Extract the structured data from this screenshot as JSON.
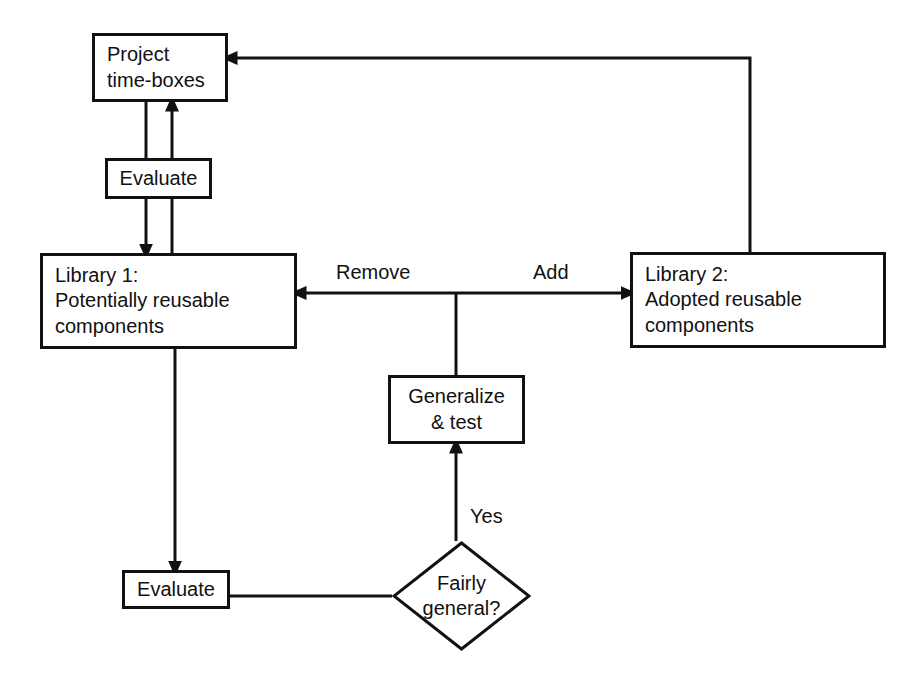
{
  "diagram": {
    "type": "flowchart",
    "background_color": "#ffffff",
    "line_color": "#111111",
    "text_color": "#111111",
    "nodes": [
      {
        "id": "project-time-boxes",
        "shape": "rectangle",
        "lines": [
          "Project",
          "time-boxes"
        ],
        "x": 92,
        "y": 33,
        "w": 136,
        "h": 69,
        "align": "left",
        "font_size": 20
      },
      {
        "id": "evaluate-top",
        "shape": "rectangle",
        "lines": [
          "Evaluate"
        ],
        "x": 105,
        "y": 158,
        "w": 107,
        "h": 41,
        "align": "center",
        "font_size": 20
      },
      {
        "id": "library-1",
        "shape": "rectangle",
        "lines": [
          "Library 1:",
          "Potentially reusable",
          "components"
        ],
        "x": 40,
        "y": 253,
        "w": 257,
        "h": 96,
        "align": "left",
        "font_size": 20
      },
      {
        "id": "library-2",
        "shape": "rectangle",
        "lines": [
          "Library 2:",
          "Adopted reusable",
          "components"
        ],
        "x": 630,
        "y": 252,
        "w": 256,
        "h": 96,
        "align": "left",
        "font_size": 20
      },
      {
        "id": "generalize-test",
        "shape": "rectangle",
        "lines": [
          "Generalize",
          "& test"
        ],
        "x": 388,
        "y": 375,
        "w": 137,
        "h": 69,
        "align": "center",
        "font_size": 20
      },
      {
        "id": "evaluate-bottom",
        "shape": "rectangle",
        "lines": [
          "Evaluate"
        ],
        "x": 122,
        "y": 570,
        "w": 108,
        "h": 39,
        "align": "center",
        "font_size": 20
      },
      {
        "id": "fairly-general",
        "shape": "diamond",
        "lines": [
          "Fairly",
          "general?"
        ],
        "x": 392,
        "y": 541,
        "w": 139,
        "h": 110,
        "align": "center",
        "font_size": 20
      }
    ],
    "edge_labels": [
      {
        "id": "remove-label",
        "text": "Remove",
        "x": 336,
        "y": 261,
        "font_size": 20
      },
      {
        "id": "add-label",
        "text": "Add",
        "x": 533,
        "y": 261,
        "font_size": 20
      },
      {
        "id": "yes-label",
        "text": "Yes",
        "x": 470,
        "y": 505,
        "font_size": 20
      }
    ],
    "edges": [
      {
        "id": "library2-to-project-feedback",
        "from": "library-2",
        "to": "project-time-boxes",
        "label": ""
      },
      {
        "id": "evaluate-top-to-library1",
        "from": "evaluate-top",
        "to": "library-1",
        "label": ""
      },
      {
        "id": "library1-to-project-timeboxes",
        "from": "library-1",
        "to": "project-time-boxes",
        "label": ""
      },
      {
        "id": "library1-to-evaluate-bottom",
        "from": "library-1",
        "to": "evaluate-bottom",
        "label": ""
      },
      {
        "id": "evaluate-bottom-to-fairly-general",
        "from": "evaluate-bottom",
        "to": "fairly-general",
        "label": ""
      },
      {
        "id": "fairly-general-to-generalize",
        "from": "fairly-general",
        "to": "generalize-test",
        "label": "Yes"
      },
      {
        "id": "generalize-to-library1",
        "from": "generalize-test",
        "to": "library-1",
        "label": "Remove"
      },
      {
        "id": "generalize-to-library2",
        "from": "generalize-test",
        "to": "library-2",
        "label": "Add"
      }
    ]
  }
}
